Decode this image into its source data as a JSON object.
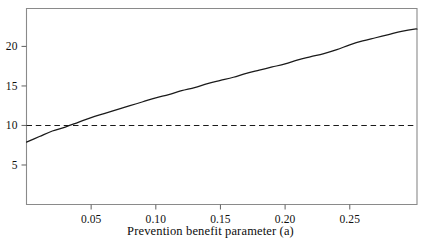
{
  "chart_data": {
    "type": "line",
    "title": "",
    "xlabel": "Prevention benefit parameter (a)",
    "ylabel": "",
    "xlim": [
      0.0,
      0.302
    ],
    "ylim": [
      0.0,
      24.8
    ],
    "grid": false,
    "legend": "none",
    "xticks": [
      0.05,
      0.1,
      0.15,
      0.2,
      0.25
    ],
    "xticklabels": [
      "0.05",
      "0.10",
      "0.15",
      "0.20",
      "0.25"
    ],
    "yticks": [
      5,
      10,
      15,
      20
    ],
    "yticklabels": [
      "5",
      "10",
      "15",
      "20"
    ],
    "series": [
      {
        "name": "model-curve",
        "style": "solid",
        "color": "#1a1a1a",
        "x": [
          0.0,
          0.01,
          0.02,
          0.03,
          0.04,
          0.05,
          0.06,
          0.07,
          0.08,
          0.09,
          0.1,
          0.11,
          0.12,
          0.13,
          0.14,
          0.15,
          0.16,
          0.17,
          0.18,
          0.19,
          0.2,
          0.21,
          0.22,
          0.23,
          0.24,
          0.25,
          0.26,
          0.27,
          0.28,
          0.29,
          0.3,
          0.302
        ],
        "y": [
          7.9,
          8.6,
          9.3,
          9.8,
          10.4,
          11.0,
          11.5,
          12.0,
          12.5,
          13.0,
          13.5,
          13.9,
          14.4,
          14.8,
          15.3,
          15.7,
          16.1,
          16.6,
          17.0,
          17.4,
          17.8,
          18.3,
          18.7,
          19.1,
          19.6,
          20.2,
          20.7,
          21.1,
          21.5,
          21.9,
          22.2,
          22.2
        ]
      },
      {
        "name": "threshold-line",
        "style": "dashed",
        "color": "#1a1a1a",
        "x": [
          0.0,
          0.302
        ],
        "y": [
          10.0,
          10.0
        ]
      }
    ],
    "annotations": [
      {
        "name": "threshold-crossing",
        "x": 0.033,
        "y": 10.0,
        "text": ""
      }
    ],
    "axis_color": "#8a8a8a"
  },
  "figure": {
    "background": "#ffffff"
  }
}
